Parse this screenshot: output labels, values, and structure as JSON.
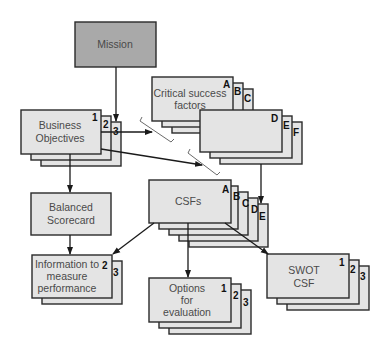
{
  "diagram": {
    "nodes": {
      "mission": {
        "label": "Mission"
      },
      "business_objectives": {
        "line1": "Business",
        "line2": "Objectives",
        "tags": [
          "1",
          "2",
          "3"
        ]
      },
      "critical_success_factors": {
        "line1": "Critical success",
        "line2": "factors",
        "tags": [
          "A",
          "B",
          "C"
        ]
      },
      "csf_continued": {
        "tags": [
          "D",
          "E",
          "F"
        ]
      },
      "balanced_scorecard": {
        "line1": "Balanced",
        "line2": "Scorecard"
      },
      "csfs": {
        "label": "CSFs",
        "tags": [
          "A",
          "B",
          "C",
          "D",
          "E"
        ]
      },
      "information": {
        "line1": "Information to",
        "line2": "measure",
        "line3": "performance",
        "tags": [
          "2",
          "3"
        ]
      },
      "options": {
        "line1": "Options",
        "line2": "for",
        "line3": "evaluation",
        "tags": [
          "1",
          "2",
          "3"
        ]
      },
      "swot": {
        "line1": "SWOT",
        "line2": "CSF",
        "tags": [
          "1",
          "2",
          "3"
        ]
      }
    },
    "edges": [
      {
        "from": "Mission",
        "to": "Business Objectives"
      },
      {
        "from": "Business Objectives",
        "to": "Critical success factors"
      },
      {
        "from": "Business Objectives",
        "to": "CSFs"
      },
      {
        "from": "Business Objectives",
        "to": "Balanced Scorecard"
      },
      {
        "from": "Balanced Scorecard",
        "to": "Information to measure performance"
      },
      {
        "from": "Critical success factors",
        "to": "CSFs"
      },
      {
        "from": "CSFs",
        "to": "Information to measure performance"
      },
      {
        "from": "CSFs",
        "to": "Options for evaluation"
      },
      {
        "from": "CSFs",
        "to": "SWOT CSF"
      }
    ]
  }
}
